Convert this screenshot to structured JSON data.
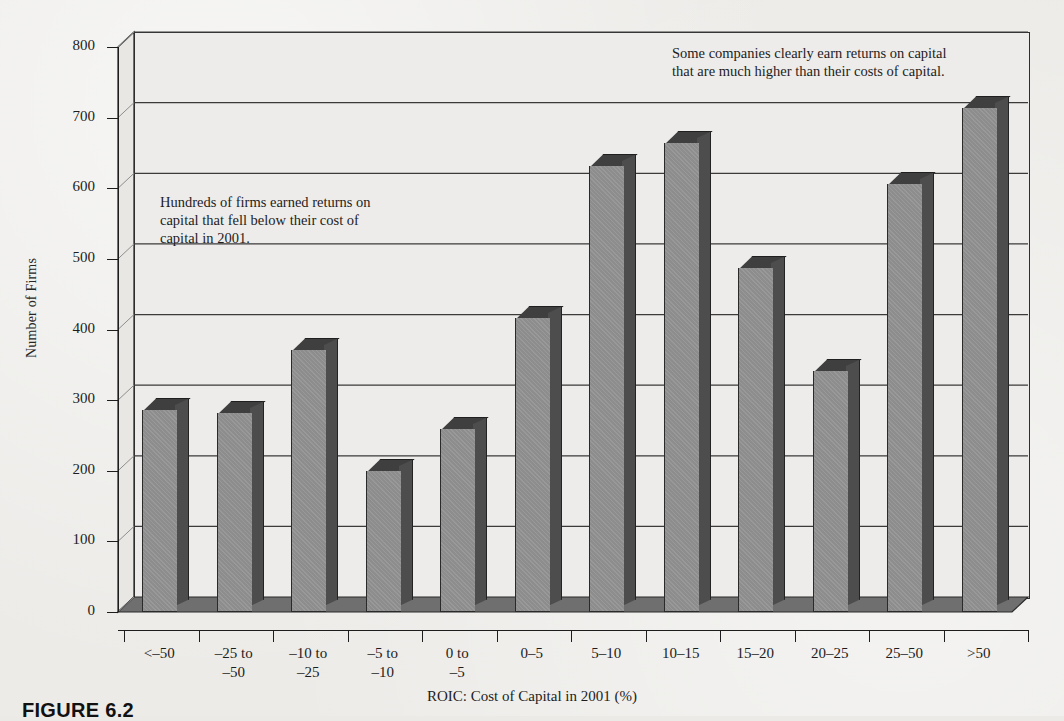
{
  "figure": {
    "caption": "FIGURE 6.2"
  },
  "chart_data": {
    "type": "bar",
    "title": "",
    "xlabel": "ROIC: Cost of Capital in 2001 (%)",
    "ylabel": "Number of Firms",
    "ylim": [
      0,
      800
    ],
    "ytick_values": [
      0,
      100,
      200,
      300,
      400,
      500,
      600,
      700,
      800
    ],
    "ytick_labels": [
      "0",
      "100",
      "200",
      "300",
      "400",
      "500",
      "600",
      "700",
      "800"
    ],
    "grid": true,
    "legend": "none",
    "style": "3d-column",
    "categories": [
      "<–50",
      "–25 to\n–50",
      "–10 to\n–25",
      "–5 to\n–10",
      "0 to\n–5",
      "0–5",
      "5–10",
      "10–15",
      "15–20",
      "20–25",
      "25–50",
      ">50"
    ],
    "values": [
      285,
      280,
      370,
      198,
      258,
      415,
      630,
      662,
      485,
      340,
      605,
      712
    ],
    "bar_color": "#8d8d8d",
    "bar_side_color": "#4d4d4d",
    "bar_top_color": "#3f3f3f",
    "plot_background": "#eeecea",
    "annotations": [
      {
        "id": "left-annotation",
        "text": "Hundreds of firms earned returns on capital that fell below their cost of capital in 2001.",
        "lines": [
          "Hundreds of firms earned returns on",
          "capital that fell below their cost of",
          "capital in 2001."
        ]
      },
      {
        "id": "right-annotation",
        "text": "Some companies clearly earn returns on capital that are much higher than their costs of capital.",
        "lines": [
          "Some companies clearly earn returns on capital",
          "that are much higher than their costs of capital."
        ]
      }
    ]
  }
}
